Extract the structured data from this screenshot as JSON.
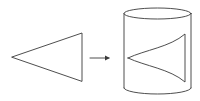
{
  "diagram": {
    "stroke_color": "#3a3a3a",
    "background": "#ffffff",
    "nodes": [
      {
        "id": "flat-triangle",
        "shape": "triangle",
        "points": [
          [
            12,
            57
          ],
          [
            82,
            33
          ],
          [
            82,
            81
          ]
        ]
      },
      {
        "id": "cylinder",
        "shape": "cylinder",
        "cx": 157.5,
        "top_y": 13.5,
        "bottom_y": 88,
        "rx": 33.5,
        "ry": 5.5
      },
      {
        "id": "warped-triangle",
        "shape": "curved-triangle",
        "tip": [
          128,
          58
        ],
        "right_top": [
          185,
          34
        ],
        "right_bottom": [
          185,
          82
        ]
      }
    ],
    "edges": [
      {
        "from": "flat-triangle",
        "to": "cylinder",
        "type": "arrow",
        "x1": 90,
        "x2": 110,
        "y": 58
      }
    ]
  }
}
